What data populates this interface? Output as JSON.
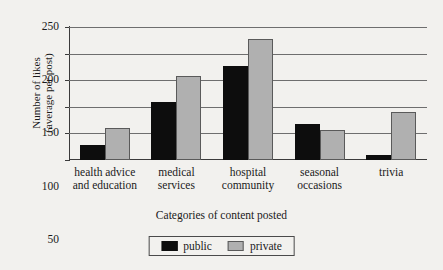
{
  "chart_data": {
    "type": "bar",
    "title": "",
    "xlabel": "Categories of content posted",
    "ylabel_line1": "Number of likes",
    "ylabel_line2": "(average per post)",
    "categories": [
      "health advice and education",
      "medical services",
      "hospital community",
      "seasonal occasions",
      "trivia"
    ],
    "category_lines": [
      [
        "health advice",
        "and education"
      ],
      [
        "medical",
        "services"
      ],
      [
        "hospital",
        "community"
      ],
      [
        "seasonal",
        "occasions"
      ],
      [
        "trivia",
        ""
      ]
    ],
    "series": [
      {
        "name": "public",
        "color": "#0d0d0d",
        "values": [
          28,
          109,
          177,
          68,
          10
        ]
      },
      {
        "name": "private",
        "color": "#b0b0b0",
        "values": [
          60,
          158,
          228,
          56,
          90
        ]
      }
    ],
    "ylim": [
      0,
      250
    ],
    "yticks": [
      0,
      50,
      100,
      150,
      200,
      250
    ],
    "ytick_labels": [
      "0",
      "50",
      "100",
      "150",
      "200",
      "250"
    ],
    "grid": true,
    "legend_position": "bottom-center"
  },
  "legend": {
    "items": [
      {
        "label": "public",
        "color": "#0d0d0d"
      },
      {
        "label": "private",
        "color": "#b0b0b0"
      }
    ]
  }
}
